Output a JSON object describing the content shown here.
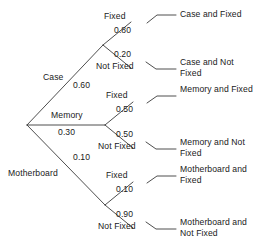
{
  "diagram": {
    "type": "probability-tree",
    "title": "",
    "root": {
      "label": "",
      "x": 27,
      "y": 125
    },
    "colors": {
      "line": "#3a3a3a",
      "text": "#1a1a1a",
      "background": "#ffffff"
    },
    "branches": [
      {
        "name": "case",
        "label": "Case",
        "probability": "0.60",
        "node": {
          "x": 103,
          "y": 45
        },
        "children": [
          {
            "name": "case-fixed",
            "label": "Fixed",
            "probability": "0.80",
            "outcome": "Case and Fixed"
          },
          {
            "name": "case-not-fixed",
            "label": "Not Fixed",
            "probability": "0.20",
            "outcome": "Case and Not Fixed"
          }
        ]
      },
      {
        "name": "memory",
        "label": "Memory",
        "probability": "0.30",
        "node": {
          "x": 105,
          "y": 125
        },
        "children": [
          {
            "name": "memory-fixed",
            "label": "Fixed",
            "probability": "0.50",
            "outcome": "Memory and Fixed"
          },
          {
            "name": "memory-not-fixed",
            "label": "Not Fixed",
            "probability": "0.50",
            "outcome": "Memory and Not Fixed"
          }
        ]
      },
      {
        "name": "motherboard",
        "label": "Motherboard",
        "probability": "0.10",
        "node": {
          "x": 105,
          "y": 205
        },
        "children": [
          {
            "name": "motherboard-fixed",
            "label": "Fixed",
            "probability": "0.10",
            "outcome": "Motherboard and Fixed"
          },
          {
            "name": "motherboard-not-fixed",
            "label": "Not Fixed",
            "probability": "0.90",
            "outcome": "Motherboard and Not Fixed"
          }
        ]
      }
    ]
  },
  "labels": {
    "case": "Case",
    "case_p": "0.60",
    "memory": "Memory",
    "memory_p": "0.30",
    "motherboard": "Motherboard",
    "motherboard_p": "0.10",
    "fixed_1": "Fixed",
    "fixed_1_p": "0.80",
    "notfixed_1": "Not Fixed",
    "notfixed_1_p": "0.20",
    "fixed_2": "Fixed",
    "fixed_2_p": "0.50",
    "notfixed_2": "Not Fixed",
    "notfixed_2_p": "0.50",
    "fixed_3": "Fixed",
    "fixed_3_p": "0.10",
    "notfixed_3": "Not Fixed",
    "notfixed_3_p": "0.90",
    "outcome_1": "Case and Fixed",
    "outcome_2": "Case and Not Fixed",
    "outcome_3": "Memory and Fixed",
    "outcome_4": "Memory and Not Fixed",
    "outcome_5": "Motherboard and Fixed",
    "outcome_6": "Motherboard and Not Fixed"
  }
}
